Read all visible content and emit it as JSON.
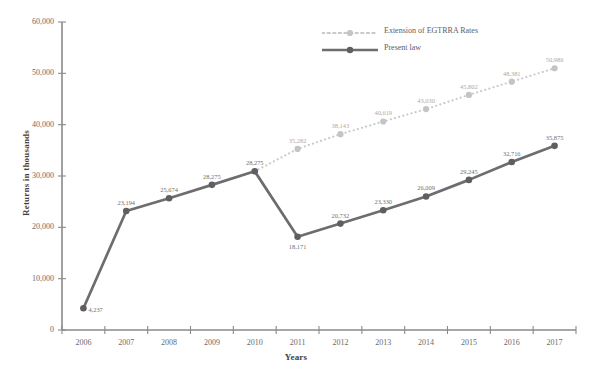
{
  "chart_data": {
    "type": "line",
    "title": "",
    "xlabel": "Years",
    "ylabel": "Returns in thousands",
    "categories": [
      "2006",
      "2007",
      "2008",
      "2009",
      "2010",
      "2011",
      "2012",
      "2013",
      "2014",
      "2015",
      "2016",
      "2017"
    ],
    "xlim": [
      2006,
      2017
    ],
    "ylim": [
      0,
      60000
    ],
    "yticks": [
      0,
      10000,
      20000,
      30000,
      40000,
      50000,
      60000
    ],
    "ytick_labels": [
      "0",
      "10,000",
      "20,000",
      "30,000",
      "40,000",
      "50,000",
      "60,000"
    ],
    "grid": false,
    "legend_position": "top-right",
    "series": [
      {
        "name": "Extension of EGTRRA Rates",
        "style": "dotted",
        "color": "#c9c9cb",
        "x": [
          "2010",
          "2011",
          "2012",
          "2013",
          "2014",
          "2015",
          "2016",
          "2017"
        ],
        "values": [
          30914,
          35282,
          38143,
          40619,
          43030,
          45802,
          48381,
          50986
        ],
        "labels": [
          "30,914",
          "35,282",
          "38,143",
          "40,619",
          "43,030",
          "45,802",
          "48,381",
          "50,986"
        ]
      },
      {
        "name": "Present law",
        "style": "solid",
        "color": "#6d6d6f",
        "x": [
          "2006",
          "2007",
          "2008",
          "2009",
          "2010",
          "2011",
          "2012",
          "2013",
          "2014",
          "2015",
          "2016",
          "2017"
        ],
        "values": [
          4237,
          23194,
          25674,
          28275,
          30914,
          18171,
          20732,
          23330,
          26009,
          29245,
          32716,
          35875
        ],
        "labels": [
          "4,237",
          "23,194",
          "25,674",
          "28,275",
          "28,275",
          "18,171",
          "20,732",
          "23,330",
          "26,009",
          "29,245",
          "32,716",
          "35,875"
        ]
      }
    ]
  },
  "legend": {
    "items": [
      {
        "label": "Extension of EGTRRA Rates",
        "color": "#c9c9cb",
        "style": "dotted"
      },
      {
        "label": "Present law",
        "color": "#6d6d6f",
        "style": "solid"
      }
    ]
  },
  "axes": {
    "x_title": "Years",
    "y_title": "Returns in thousands"
  }
}
